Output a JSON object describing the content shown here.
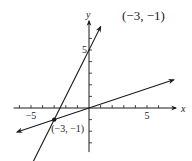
{
  "chart_data": {
    "type": "line",
    "title": "(−3, −1)",
    "xlabel": "x",
    "ylabel": "y",
    "xlim": [
      -7,
      7.5
    ],
    "ylim": [
      -4,
      7.5
    ],
    "grid": false,
    "x_ticks": [
      -6,
      -5,
      -4,
      -3,
      -2,
      -1,
      1,
      2,
      3,
      4,
      5,
      6
    ],
    "y_ticks": [
      -3,
      -2,
      -1,
      1,
      2,
      3,
      4,
      5,
      6
    ],
    "x_tick_labels": [
      {
        "value": -5,
        "text": "−5"
      },
      {
        "value": 5,
        "text": "5"
      }
    ],
    "y_tick_labels": [
      {
        "value": 5,
        "text": "5"
      }
    ],
    "series": [
      {
        "name": "line-steep",
        "equation": "y = 2x + 5",
        "x": [
          -5.3,
          1.0
        ],
        "y": [
          -5.6,
          7.0
        ]
      },
      {
        "name": "line-shallow",
        "equation": "y = x/3",
        "x": [
          -6.2,
          7.3
        ],
        "y": [
          -2.07,
          2.43
        ]
      }
    ],
    "points": [
      {
        "x": -3,
        "y": -1,
        "label": "(−3, −1)"
      }
    ]
  }
}
